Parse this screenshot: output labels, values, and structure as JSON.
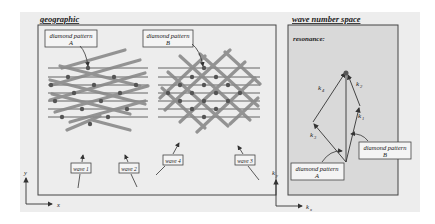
{
  "panels": {
    "geographic": {
      "title": "geographic",
      "callouts": {
        "pattern_a_line1": "diamond pattern",
        "pattern_a_line2": "A",
        "pattern_b_line1": "diamond pattern",
        "pattern_b_line2": "B"
      },
      "waves": [
        "wave 1",
        "wave 2",
        "wave 4",
        "wave 3"
      ],
      "axes": {
        "x": "x",
        "y": "y"
      }
    },
    "wavenumber": {
      "title": "wave number space",
      "subtitle": "resonance:",
      "vectors": [
        "k⃗1",
        "k⃗2",
        "k⃗3",
        "k⃗4"
      ],
      "vector_labels": {
        "k1": "k",
        "k1_sub": "1",
        "k2": "k",
        "k2_sub": "2",
        "k3": "k",
        "k3_sub": "3",
        "k4": "k",
        "k4_sub": "4"
      },
      "callouts": {
        "pattern_a_line1": "diamond pattern",
        "pattern_a_line2": "A",
        "pattern_b_line1": "diamond pattern",
        "pattern_b_line2": "B"
      },
      "axes": {
        "x": "k",
        "x_sub": "x",
        "y": "k",
        "y_sub": "y"
      }
    }
  },
  "colors": {
    "paper": "#ededed",
    "panel_right_fill": "#d9d9d9",
    "frame": "#444444",
    "thin_line": "#555555",
    "thick_bar": "#8a8a8a",
    "node": "#555555"
  }
}
